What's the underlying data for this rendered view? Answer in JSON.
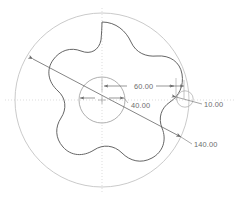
{
  "drawing": {
    "kind": "engineering-drawing",
    "view_name": "front-view",
    "units_implied": "mm",
    "background_color": "#ffffff",
    "line_color_profile": "#5a5a5a",
    "line_color_construction": "#b4b4b4",
    "line_color_centerline": "#c8c8c8",
    "line_color_dimension": "#7a7a7a",
    "text_color": "#6d6d6d"
  },
  "geometry": {
    "center": {
      "x": 102,
      "y": 100
    },
    "outer_reference_circle": {
      "cx": 102,
      "cy": 100,
      "r": 87,
      "label_ref": "140.00"
    },
    "hub_circle": {
      "cx": 102,
      "cy": 100,
      "r": 23,
      "label_ref": "40.00"
    },
    "fillet_circle": {
      "cx": 185,
      "cy": 99,
      "r": 8,
      "label_ref": "10.00"
    },
    "lobed_profile": {
      "lobe_count": 5,
      "peak_radius": 78,
      "valley_radius": 56,
      "phase_deg": -90
    }
  },
  "dimensions": [
    {
      "id": "dim-60",
      "value": "60.00",
      "type": "radial-linear",
      "text_x": 134,
      "text_y": 87,
      "note": "radius from center to lobe peak region"
    },
    {
      "id": "dim-40",
      "value": "40.00",
      "type": "diameter-hub",
      "text_x": 131,
      "text_y": 106,
      "note": "hub circle diameter"
    },
    {
      "id": "dim-10",
      "value": "10.00",
      "type": "radius-fillet",
      "text_x": 205,
      "text_y": 108,
      "note": "fillet radius at right lobe"
    },
    {
      "id": "dim-140",
      "value": "140.00",
      "type": "diameter-overall",
      "text_x": 195,
      "text_y": 148,
      "note": "overall outer diameter on diagonal leader"
    }
  ],
  "centerlines": {
    "horizontal": {
      "x1": 5,
      "y1": 100,
      "x2": 235,
      "y2": 100,
      "style": "dotted"
    },
    "vertical": {
      "x1": 102,
      "y1": 8,
      "x2": 102,
      "y2": 194,
      "style": "dotted"
    }
  },
  "leaders": {
    "diagonal_140": {
      "x1": 32,
      "y1": 58,
      "x2": 182,
      "y2": 138
    },
    "leader_140_tail": {
      "x1": 182,
      "y1": 138,
      "x2": 193,
      "y2": 145
    },
    "leader_10_tail": {
      "x1": 186,
      "y1": 101,
      "x2": 202,
      "y2": 105
    }
  }
}
